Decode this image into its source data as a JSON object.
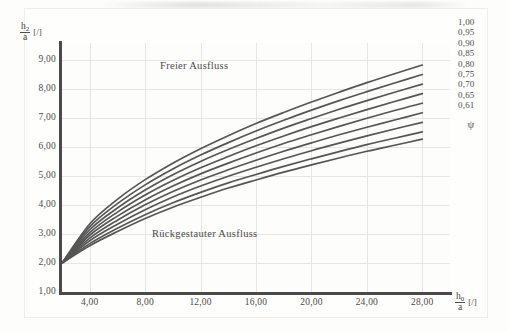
{
  "chart_data": {
    "type": "line",
    "title": "",
    "xlabel": "h0/a [/]",
    "ylabel": "h2/a [/]",
    "xlabel_num": "h",
    "xlabel_num_sub": "0",
    "xlabel_den": "a",
    "xlabel_unit": "[/]",
    "ylabel_num": "h",
    "ylabel_num_sub": "2",
    "ylabel_den": "a",
    "ylabel_unit": "[/]",
    "xlim": [
      2,
      30
    ],
    "ylim": [
      1,
      9.6
    ],
    "xticks": [
      "4,00",
      "8,00",
      "12,00",
      "16,00",
      "20,00",
      "24,00",
      "28,00"
    ],
    "xtick_values": [
      4,
      8,
      12,
      16,
      20,
      24,
      28
    ],
    "yticks": [
      "1,00",
      "2,00",
      "3,00",
      "4,00",
      "5,00",
      "6,00",
      "7,00",
      "8,00",
      "9,00"
    ],
    "ytick_values": [
      1,
      2,
      3,
      4,
      5,
      6,
      7,
      8,
      9
    ],
    "grid": true,
    "legend_position": "right",
    "legend_title": "ψ",
    "annotations": [
      {
        "text": "Freier Ausfluss",
        "x": 12.5,
        "y": 8.55
      },
      {
        "text": "Rückgestauter Ausfluss",
        "x": 12.0,
        "y": 2.75
      }
    ],
    "series": [
      {
        "name": "1,00",
        "x": [
          2,
          4,
          6,
          8,
          10,
          12,
          14,
          16,
          18,
          20,
          22,
          24,
          26,
          28
        ],
        "values": [
          2.0,
          3.35,
          4.2,
          4.88,
          5.45,
          5.95,
          6.4,
          6.82,
          7.2,
          7.56,
          7.9,
          8.23,
          8.54,
          8.84
        ]
      },
      {
        "name": "0,95",
        "x": [
          2,
          4,
          6,
          8,
          10,
          12,
          14,
          16,
          18,
          20,
          22,
          24,
          26,
          28
        ],
        "values": [
          2.0,
          3.25,
          4.05,
          4.7,
          5.25,
          5.73,
          6.16,
          6.56,
          6.93,
          7.28,
          7.61,
          7.92,
          8.22,
          8.51
        ]
      },
      {
        "name": "0,90",
        "x": [
          2,
          4,
          6,
          8,
          10,
          12,
          14,
          16,
          18,
          20,
          22,
          24,
          26,
          28
        ],
        "values": [
          2.0,
          3.15,
          3.9,
          4.52,
          5.05,
          5.51,
          5.92,
          6.3,
          6.66,
          6.99,
          7.31,
          7.61,
          7.9,
          8.18
        ]
      },
      {
        "name": "0,85",
        "x": [
          2,
          4,
          6,
          8,
          10,
          12,
          14,
          16,
          18,
          20,
          22,
          24,
          26,
          28
        ],
        "values": [
          2.0,
          3.05,
          3.76,
          4.35,
          4.85,
          5.29,
          5.68,
          6.05,
          6.39,
          6.71,
          7.01,
          7.3,
          7.58,
          7.85
        ]
      },
      {
        "name": "0,80",
        "x": [
          2,
          4,
          6,
          8,
          10,
          12,
          14,
          16,
          18,
          20,
          22,
          24,
          26,
          28
        ],
        "values": [
          2.0,
          2.96,
          3.62,
          4.18,
          4.66,
          5.08,
          5.45,
          5.8,
          6.13,
          6.43,
          6.72,
          7.0,
          7.27,
          7.52
        ]
      },
      {
        "name": "0,75",
        "x": [
          2,
          4,
          6,
          8,
          10,
          12,
          14,
          16,
          18,
          20,
          22,
          24,
          26,
          28
        ],
        "values": [
          2.0,
          2.86,
          3.48,
          4.01,
          4.47,
          4.87,
          5.22,
          5.55,
          5.86,
          6.15,
          6.43,
          6.69,
          6.94,
          7.19
        ]
      },
      {
        "name": "0,70",
        "x": [
          2,
          4,
          6,
          8,
          10,
          12,
          14,
          16,
          18,
          20,
          22,
          24,
          26,
          28
        ],
        "values": [
          2.0,
          2.77,
          3.34,
          3.84,
          4.28,
          4.66,
          5.0,
          5.31,
          5.6,
          5.88,
          6.14,
          6.39,
          6.63,
          6.86
        ]
      },
      {
        "name": "0,65",
        "x": [
          2,
          4,
          6,
          8,
          10,
          12,
          14,
          16,
          18,
          20,
          22,
          24,
          26,
          28
        ],
        "values": [
          2.0,
          2.67,
          3.2,
          3.67,
          4.08,
          4.44,
          4.77,
          5.06,
          5.34,
          5.6,
          5.85,
          6.09,
          6.31,
          6.53
        ]
      },
      {
        "name": "0,61",
        "x": [
          2,
          4,
          6,
          8,
          10,
          12,
          14,
          16,
          18,
          20,
          22,
          24,
          26,
          28
        ],
        "values": [
          2.0,
          2.6,
          3.09,
          3.54,
          3.93,
          4.27,
          4.59,
          4.87,
          5.14,
          5.39,
          5.63,
          5.86,
          6.07,
          6.28
        ]
      }
    ],
    "legend_entries": [
      "1,00",
      "0,95",
      "0,90",
      "0,85",
      "0,80",
      "0,75",
      "0,70",
      "0,65",
      "0,61"
    ],
    "colors": {
      "curve": "#555555",
      "axis": "#4a4a4a",
      "grid": "#e6e6e3",
      "text": "#4b4b4b",
      "background": "#fdfdfc"
    }
  }
}
